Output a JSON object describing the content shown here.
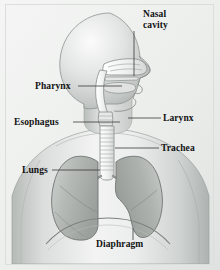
{
  "figure": {
    "view": "lateral head and anterior thorax",
    "background_color": "#f2f3f2",
    "border_color": "#dcdedc",
    "label_color": "#121212",
    "leader_line_color": "#3a3a3a",
    "body_fill_light": "#f4f5f4",
    "body_fill_shadow": "#bcc0bd",
    "lung_fill": "#b9bdbb",
    "airway_fill": "#e9ebea",
    "outline_color": "#6d7270"
  },
  "labels": [
    {
      "id": "nasal-cavity",
      "text": "Nasal\ncavity",
      "lines": [
        "Nasal",
        "cavity"
      ]
    },
    {
      "id": "pharynx",
      "text": "Pharynx",
      "lines": [
        "Pharynx"
      ]
    },
    {
      "id": "esophagus",
      "text": "Esophagus",
      "lines": [
        "Esophagus"
      ]
    },
    {
      "id": "larynx",
      "text": "Larynx",
      "lines": [
        "Larynx"
      ]
    },
    {
      "id": "trachea",
      "text": "Trachea",
      "lines": [
        "Trachea"
      ]
    },
    {
      "id": "lungs",
      "text": "Lungs",
      "lines": [
        "Lungs"
      ]
    },
    {
      "id": "diaphragm",
      "text": "Diaphragm",
      "lines": [
        "Diaphragm"
      ]
    }
  ],
  "leader_lines": [
    {
      "id": "nasal-cavity-leader",
      "orientation": "vertical",
      "x1": 134,
      "y1": 31,
      "x2": 134,
      "y2": 76
    },
    {
      "id": "pharynx-leader",
      "orientation": "horizontal",
      "x1": 78,
      "y1": 86,
      "x2": 122,
      "y2": 86
    },
    {
      "id": "esophagus-leader",
      "orientation": "horizontal",
      "x1": 73,
      "y1": 122,
      "x2": 120,
      "y2": 122
    },
    {
      "id": "larynx-leader",
      "orientation": "horizontal",
      "x1": 128,
      "y1": 118,
      "x2": 161,
      "y2": 118
    },
    {
      "id": "trachea-leader",
      "orientation": "horizontal",
      "x1": 115,
      "y1": 148,
      "x2": 159,
      "y2": 148
    },
    {
      "id": "lungs-leader",
      "orientation": "horizontal",
      "x1": 52,
      "y1": 170,
      "x2": 100,
      "y2": 170
    },
    {
      "id": "diaphragm-leader",
      "orientation": "vertical",
      "x1": 133,
      "y1": 228,
      "x2": 133,
      "y2": 240
    }
  ],
  "anatomy_parts": [
    {
      "id": "head",
      "name": "head-profile"
    },
    {
      "id": "neck",
      "name": "neck"
    },
    {
      "id": "torso",
      "name": "torso-shoulders"
    },
    {
      "id": "nasal",
      "name": "nasal-cavity-structure"
    },
    {
      "id": "palate",
      "name": "hard-palate"
    },
    {
      "id": "tongue",
      "name": "tongue"
    },
    {
      "id": "pharynx",
      "name": "pharynx-structure"
    },
    {
      "id": "larynx",
      "name": "larynx-structure"
    },
    {
      "id": "trachea",
      "name": "trachea-structure"
    },
    {
      "id": "bronchi",
      "name": "bronchi-structure"
    },
    {
      "id": "lung-left",
      "name": "left-lung"
    },
    {
      "id": "lung-right",
      "name": "right-lung"
    },
    {
      "id": "diaphragm",
      "name": "diaphragm-structure"
    }
  ]
}
